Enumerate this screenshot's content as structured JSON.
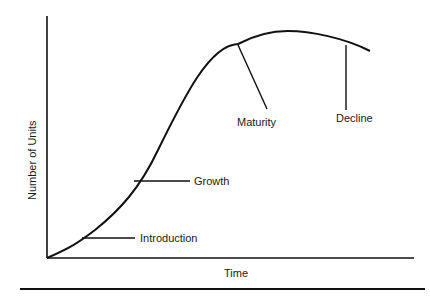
{
  "diagram": {
    "y_axis_label": "Number of Units",
    "x_axis_label": "Time",
    "stages": [
      {
        "label": "Introduction"
      },
      {
        "label": "Growth"
      },
      {
        "label": "Maturity"
      },
      {
        "label": "Decline"
      }
    ],
    "colors": {
      "line": "#111111",
      "background": "#ffffff"
    }
  }
}
